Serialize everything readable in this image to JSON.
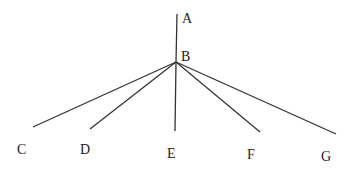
{
  "diagram": {
    "points": {
      "A": {
        "label": "A",
        "x": 177,
        "y": 14,
        "lx": 186,
        "ly": 23
      },
      "B": {
        "label": "B",
        "x": 176,
        "y": 62,
        "lx": 185,
        "ly": 60
      },
      "C": {
        "label": "C",
        "x": 33,
        "y": 127,
        "lx": 17,
        "ly": 154
      },
      "D": {
        "label": "D",
        "x": 90,
        "y": 129,
        "lx": 80,
        "ly": 154
      },
      "E": {
        "label": "E",
        "x": 175,
        "y": 131,
        "lx": 167,
        "ly": 158
      },
      "F": {
        "label": "F",
        "x": 260,
        "y": 132,
        "lx": 247,
        "ly": 159
      },
      "G": {
        "label": "G",
        "x": 336,
        "y": 134,
        "lx": 321,
        "ly": 161
      }
    },
    "segments": [
      {
        "name": "BA",
        "from": "B",
        "to": "A"
      },
      {
        "name": "BC",
        "from": "B",
        "to": "C"
      },
      {
        "name": "BD",
        "from": "B",
        "to": "D"
      },
      {
        "name": "BE",
        "from": "B",
        "to": "E"
      },
      {
        "name": "BF",
        "from": "B",
        "to": "F"
      },
      {
        "name": "BG",
        "from": "B",
        "to": "G"
      }
    ]
  }
}
